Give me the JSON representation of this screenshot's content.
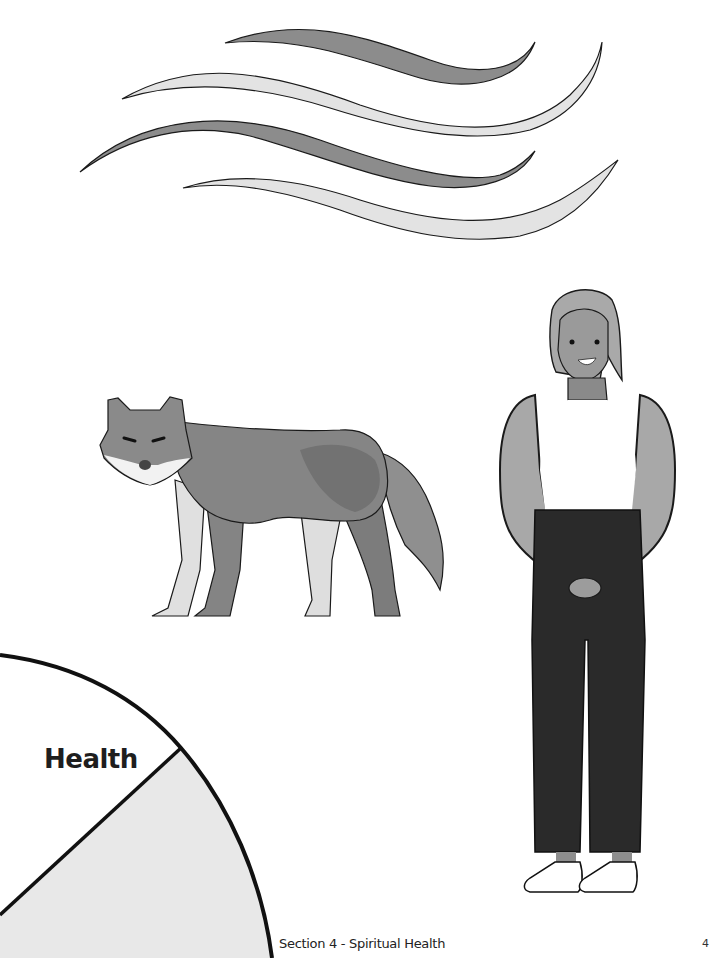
{
  "page": {
    "type": "worksheet-page",
    "background": "#ffffff"
  },
  "illustrations": {
    "wind": {
      "name": "wind-waves",
      "stripes": 4,
      "colors": [
        "#8a8a8a",
        "#e2e2e2",
        "#8a8a8a",
        "#e2e2e2"
      ]
    },
    "wolf": {
      "name": "wolf"
    },
    "person": {
      "name": "person-standing"
    }
  },
  "wheel": {
    "segment_label": "Health",
    "shaded_color": "#e8e8e8",
    "stroke_color": "#111111"
  },
  "footer": {
    "section_title": "Section 4 - Spiritual Health",
    "page_number": "4"
  }
}
